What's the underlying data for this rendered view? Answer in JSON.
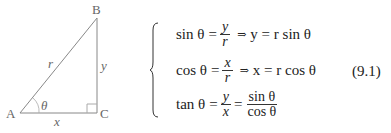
{
  "figure": {
    "vertices": {
      "A": "A",
      "B": "B",
      "C": "C"
    },
    "sides": {
      "hyp": "r",
      "opp": "y",
      "adj": "x"
    },
    "angle": "θ"
  },
  "equations": [
    {
      "lhs": "sin θ",
      "eq": "=",
      "num": "y",
      "den": "r",
      "arrow": "⇒",
      "rhs": "y = r sin θ"
    },
    {
      "lhs": "cos θ",
      "eq": "=",
      "num": "x",
      "den": "r",
      "arrow": "⇒",
      "rhs": "x = r cos θ"
    },
    {
      "lhs": "tan θ",
      "eq": "=",
      "num": "y",
      "den": "x",
      "eq2": "=",
      "num2": "sin θ",
      "den2": "cos θ"
    }
  ],
  "equation_number": "(9.1)"
}
